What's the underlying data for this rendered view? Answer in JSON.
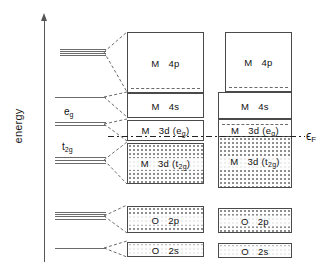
{
  "figure": {
    "type": "energy-level-band-diagram",
    "axis": {
      "label": "energy",
      "direction": "up"
    },
    "fermi": {
      "symbol": "ϵ",
      "subscript": "F",
      "label": "ϵF"
    }
  },
  "atomic_levels": [
    {
      "id": "4p",
      "tag": "",
      "tag_sub": "",
      "lines": 4,
      "y": 52,
      "degeneracy_note": "p triplet"
    },
    {
      "id": "4s",
      "tag": "",
      "tag_sub": "",
      "lines": 1,
      "y": 97,
      "degeneracy_note": "s singlet"
    },
    {
      "id": "eg",
      "tag": "e",
      "tag_sub": "g",
      "lines": 2,
      "y": 124,
      "degeneracy_note": "e_g doublet"
    },
    {
      "id": "t2g",
      "tag": "t",
      "tag_sub": "2g",
      "lines": 3,
      "y": 160,
      "degeneracy_note": "t_2g triplet"
    },
    {
      "id": "2p",
      "tag": "",
      "tag_sub": "",
      "lines": 4,
      "y": 216,
      "degeneracy_note": "O 2p"
    },
    {
      "id": "2s",
      "tag": "",
      "tag_sub": "",
      "lines": 1,
      "y": 248,
      "degeneracy_note": "O 2s"
    }
  ],
  "columns": [
    {
      "name": "narrow-band",
      "bands": [
        {
          "id": "M4p",
          "species": "M",
          "orbital": "4p",
          "sub": "",
          "filled": false
        },
        {
          "id": "M4s",
          "species": "M",
          "orbital": "4s",
          "sub": "",
          "filled": false
        },
        {
          "id": "M3deg",
          "species": "M",
          "orbital": "3d (e",
          "sub": "g",
          "tail": ")",
          "filled": false
        },
        {
          "id": "M3dt2g",
          "species": "M",
          "orbital": "3d (t",
          "sub": "2g",
          "tail": ")",
          "filled": true
        },
        {
          "id": "O2p",
          "species": "O",
          "orbital": "2p",
          "sub": "",
          "filled": true
        },
        {
          "id": "O2s",
          "species": "O",
          "orbital": "2s",
          "sub": "",
          "filled": true
        }
      ]
    },
    {
      "name": "wide-band",
      "bands": [
        {
          "id": "M4p",
          "species": "M",
          "orbital": "4p",
          "sub": "",
          "filled": false
        },
        {
          "id": "M4s",
          "species": "M",
          "orbital": "4s",
          "sub": "",
          "filled": false
        },
        {
          "id": "M3deg",
          "species": "M",
          "orbital": "3d (e",
          "sub": "g",
          "tail": ")",
          "filled": false
        },
        {
          "id": "M3dt2g",
          "species": "M",
          "orbital": "3d (t",
          "sub": "2g",
          "tail": ")",
          "filled": true
        },
        {
          "id": "O2p",
          "species": "O",
          "orbital": "2p",
          "sub": "",
          "filled": true
        },
        {
          "id": "O2s",
          "species": "O",
          "orbital": "2s",
          "sub": "",
          "filled": true
        }
      ]
    }
  ],
  "labels": {
    "M": "M",
    "O": "O",
    "o_4p": "4p",
    "o_4s": "4s",
    "o_3d_eg_pre": "3d (e",
    "o_3d_eg_sub": "g",
    "o_3d_eg_post": ")",
    "o_3d_t2g_pre": "3d (t",
    "o_3d_t2g_sub": "2g",
    "o_3d_t2g_post": ")",
    "o_2p": "2p",
    "o_2s": "2s",
    "tag_eg_base": "e",
    "tag_eg_sub": "g",
    "tag_t2g_base": "t",
    "tag_t2g_sub": "2g",
    "energy": "energy",
    "fermi_base": "ϵ",
    "fermi_sub": "F"
  }
}
